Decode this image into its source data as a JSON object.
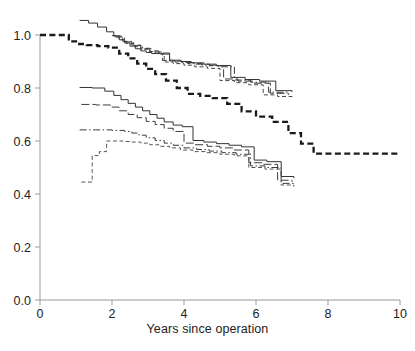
{
  "chart_data": {
    "type": "line",
    "title": "",
    "subtitle": "",
    "xlabel": "Years since operation",
    "ylabel": "",
    "xlim": [
      0,
      10
    ],
    "ylim": [
      0.0,
      1.0
    ],
    "xticks": [
      0,
      2,
      4,
      6,
      8,
      10
    ],
    "xticklabels": [
      "0",
      "2",
      "4",
      "6",
      "8",
      "10"
    ],
    "yticks": [
      0.0,
      0.2,
      0.4,
      0.6,
      0.8,
      1.0
    ],
    "yticklabels": [
      "0.0",
      "0.2",
      "0.4",
      "0.6",
      "0.8",
      "1.0"
    ],
    "grid": false,
    "legend": "none",
    "legend_position": "none",
    "step_type": "post",
    "annotations": [],
    "series": [
      {
        "name": "upper-group-solid",
        "style": "solid",
        "width": 1,
        "color": "#333333",
        "x": [
          1.1,
          1.35,
          1.6,
          1.85,
          2.05,
          2.2,
          2.35,
          2.5,
          2.65,
          2.8,
          2.95,
          3.1,
          3.35,
          3.6,
          3.9,
          4.2,
          4.55,
          4.9,
          5.3,
          5.7,
          6.1,
          6.55,
          7.0
        ],
        "y": [
          1.055,
          1.045,
          1.03,
          1.012,
          0.996,
          0.982,
          0.97,
          0.958,
          0.948,
          0.94,
          0.934,
          0.93,
          0.928,
          0.905,
          0.9,
          0.895,
          0.89,
          0.885,
          0.84,
          0.832,
          0.826,
          0.79,
          0.785
        ]
      },
      {
        "name": "upper-group-dashed",
        "style": "dashed",
        "width": 1,
        "color": "#444444",
        "x": [
          2.0,
          2.2,
          2.4,
          2.6,
          2.8,
          3.0,
          3.2,
          3.45,
          3.7,
          4.0,
          4.3,
          4.65,
          5.0,
          5.4,
          5.8,
          6.2,
          6.6,
          7.0
        ],
        "y": [
          0.998,
          0.982,
          0.968,
          0.956,
          0.946,
          0.938,
          0.93,
          0.898,
          0.892,
          0.886,
          0.88,
          0.874,
          0.828,
          0.82,
          0.812,
          0.774,
          0.768,
          0.762
        ]
      },
      {
        "name": "upper-group-longdash",
        "style": "longdash",
        "width": 1,
        "color": "#3c3c3c",
        "x": [
          2.05,
          2.3,
          2.55,
          2.8,
          3.05,
          3.3,
          3.6,
          3.95,
          4.3,
          4.7,
          5.1,
          5.5,
          5.95,
          6.4,
          6.9
        ],
        "y": [
          0.996,
          0.976,
          0.962,
          0.95,
          0.94,
          0.932,
          0.902,
          0.896,
          0.89,
          0.884,
          0.834,
          0.826,
          0.818,
          0.78,
          0.774
        ]
      },
      {
        "name": "upper-group-dashdot",
        "style": "dashdot",
        "width": 1,
        "color": "#3c3c3c",
        "x": [
          2.1,
          2.35,
          2.6,
          2.85,
          3.1,
          3.4,
          3.75,
          4.1,
          4.5,
          4.95,
          5.4,
          5.85,
          6.35,
          6.9
        ],
        "y": [
          0.992,
          0.974,
          0.96,
          0.948,
          0.936,
          0.904,
          0.898,
          0.892,
          0.886,
          0.88,
          0.83,
          0.822,
          0.784,
          0.778
        ]
      },
      {
        "name": "bold-dashed-curve",
        "style": "bold-dashed",
        "width": 2.3,
        "color": "#1a1a1a",
        "x": [
          0.0,
          0.55,
          0.8,
          1.0,
          1.3,
          1.6,
          1.9,
          2.2,
          2.45,
          2.7,
          2.95,
          3.2,
          3.5,
          3.8,
          4.1,
          4.45,
          4.8,
          5.2,
          5.6,
          6.0,
          6.45,
          6.9,
          7.25,
          7.6,
          10.0
        ],
        "y": [
          1.0,
          1.0,
          0.976,
          0.966,
          0.962,
          0.958,
          0.952,
          0.93,
          0.912,
          0.892,
          0.872,
          0.852,
          0.828,
          0.8,
          0.778,
          0.77,
          0.762,
          0.74,
          0.712,
          0.692,
          0.672,
          0.63,
          0.59,
          0.552,
          0.552
        ]
      },
      {
        "name": "lower-group-solid",
        "style": "solid",
        "width": 1,
        "color": "#333333",
        "x": [
          1.1,
          1.45,
          1.8,
          2.05,
          2.25,
          2.45,
          2.65,
          2.85,
          3.05,
          3.25,
          3.45,
          3.7,
          3.95,
          4.25,
          4.55,
          4.9,
          5.25,
          5.6,
          5.95,
          6.3,
          6.7,
          7.05
        ],
        "y": [
          0.802,
          0.8,
          0.788,
          0.772,
          0.756,
          0.742,
          0.728,
          0.714,
          0.7,
          0.686,
          0.672,
          0.66,
          0.654,
          0.602,
          0.596,
          0.59,
          0.584,
          0.578,
          0.528,
          0.522,
          0.466,
          0.46
        ]
      },
      {
        "name": "lower-group-longdash",
        "style": "longdash",
        "width": 1,
        "color": "#3c3c3c",
        "x": [
          1.15,
          1.55,
          1.95,
          2.2,
          2.45,
          2.7,
          2.95,
          3.2,
          3.45,
          3.7,
          4.0,
          4.3,
          4.65,
          5.0,
          5.4,
          5.8,
          6.2,
          6.6,
          7.0
        ],
        "y": [
          0.738,
          0.736,
          0.728,
          0.714,
          0.7,
          0.688,
          0.674,
          0.662,
          0.648,
          0.636,
          0.592,
          0.586,
          0.58,
          0.574,
          0.566,
          0.518,
          0.512,
          0.452,
          0.446
        ]
      },
      {
        "name": "lower-group-dashdot",
        "style": "dashdot",
        "width": 1,
        "color": "#3c3c3c",
        "x": [
          1.1,
          1.55,
          2.0,
          2.35,
          2.55,
          2.75,
          2.95,
          3.2,
          3.45,
          3.7,
          4.0,
          4.35,
          4.7,
          5.05,
          5.45,
          5.85,
          6.25,
          6.7,
          7.05
        ],
        "y": [
          0.642,
          0.642,
          0.64,
          0.636,
          0.63,
          0.622,
          0.612,
          0.602,
          0.592,
          0.584,
          0.574,
          0.568,
          0.562,
          0.556,
          0.55,
          0.506,
          0.5,
          0.44,
          0.434
        ]
      },
      {
        "name": "lower-group-dashed",
        "style": "dashed",
        "width": 1,
        "color": "#555555",
        "x": [
          1.15,
          1.3,
          1.45,
          1.65,
          1.85,
          2.05,
          2.3,
          2.55,
          2.8,
          3.05,
          3.3,
          3.6,
          3.9,
          4.25,
          4.6,
          5.0,
          5.4,
          5.8,
          6.25,
          6.7,
          7.05
        ],
        "y": [
          0.445,
          0.445,
          0.545,
          0.56,
          0.6,
          0.6,
          0.598,
          0.596,
          0.592,
          0.586,
          0.58,
          0.574,
          0.566,
          0.56,
          0.556,
          0.55,
          0.544,
          0.5,
          0.494,
          0.434,
          0.428
        ]
      }
    ]
  },
  "axes": {
    "x_axis_label": "Years since operation",
    "tick_color": "#9a9a9a",
    "axis_color": "#9a9a9a"
  },
  "caption": {
    "text": ""
  }
}
